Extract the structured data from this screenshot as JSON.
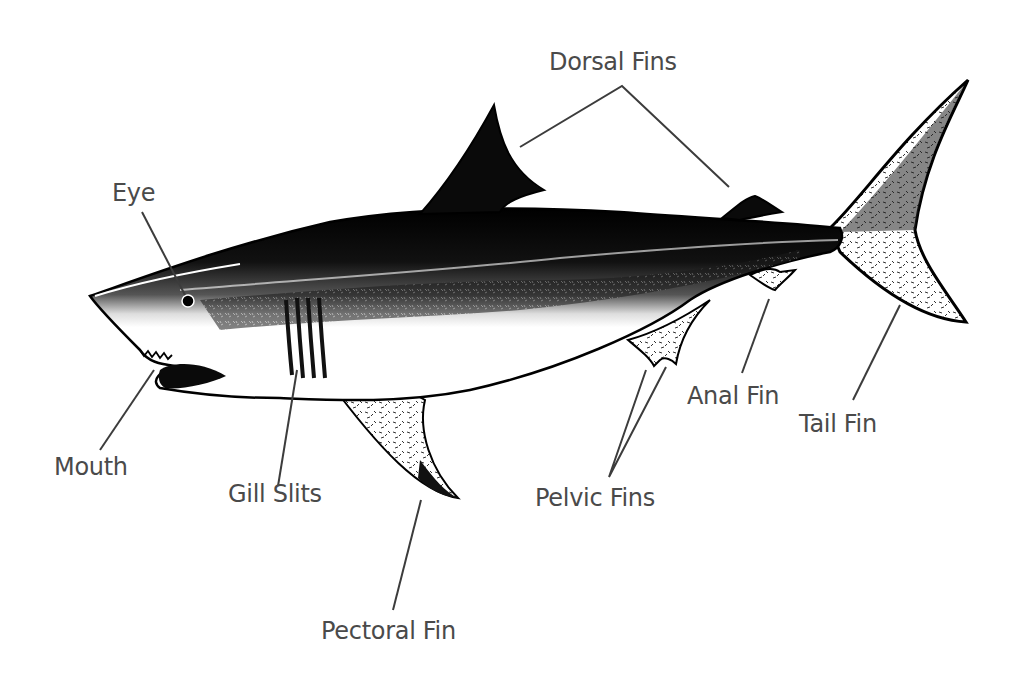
{
  "diagram": {
    "colors": {
      "label_text": "#4a4a4a",
      "leader_line": "#3c3c3c",
      "ink": "#0a0a0a",
      "background": "#ffffff"
    },
    "labels": [
      {
        "id": "dorsal-fins",
        "text": "Dorsal Fins",
        "x": 549,
        "y": 50
      },
      {
        "id": "eye",
        "text": "Eye",
        "x": 112,
        "y": 181
      },
      {
        "id": "mouth",
        "text": "Mouth",
        "x": 54,
        "y": 455
      },
      {
        "id": "gill-slits",
        "text": "Gill Slits",
        "x": 228,
        "y": 482
      },
      {
        "id": "pectoral-fin",
        "text": "Pectoral Fin",
        "x": 321,
        "y": 619
      },
      {
        "id": "pelvic-fins",
        "text": "Pelvic Fins",
        "x": 535,
        "y": 486
      },
      {
        "id": "anal-fin",
        "text": "Anal Fin",
        "x": 687,
        "y": 384
      },
      {
        "id": "tail-fin",
        "text": "Tail Fin",
        "x": 799,
        "y": 412
      }
    ]
  }
}
